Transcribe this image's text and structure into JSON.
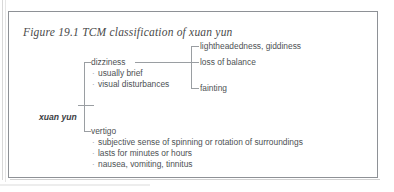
{
  "figure": {
    "caption": "Figure 19.1 TCM classification of  xuan yun",
    "root": "xuan yun",
    "bullet_glyph": "·",
    "colors": {
      "border": "#8e9196",
      "line": "#9a9ea2",
      "text": "#4d5154",
      "caption_text": "#4a4a4a",
      "background": "#ffffff"
    },
    "branches": [
      {
        "label": "dizziness",
        "features": [
          "usually brief",
          "visual disturbances"
        ],
        "manifestations": [
          "lightheadedness, giddiness",
          "loss of balance",
          "fainting"
        ]
      },
      {
        "label": "vertigo",
        "features": [
          "subjective sense of spinning or rotation of surroundings",
          "lasts for minutes or hours",
          "nausea, vomiting, tinnitus"
        ],
        "manifestations": []
      }
    ]
  }
}
